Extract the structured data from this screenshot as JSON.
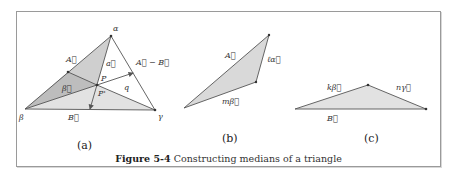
{
  "figure": {
    "caption_label": "Figure 5-4",
    "caption_text": "Constructing medians of a triangle",
    "panels": [
      {
        "id": "a",
        "label": "(a)",
        "vertices": {
          "alpha": "α",
          "beta": "β",
          "gamma": "γ"
        },
        "vector_labels": {
          "A": "A⃗",
          "B": "B⃗",
          "a": "a⃗",
          "beta_vec": "β⃗",
          "A_minus_B": "A⃗ − B⃗",
          "q": "q"
        },
        "points": {
          "P": "P",
          "P_prime": "P'"
        }
      },
      {
        "id": "b",
        "label": "(b)",
        "vector_labels": {
          "A": "A⃗",
          "l_alpha": "ℓα⃗",
          "m_beta": "mβ⃗"
        }
      },
      {
        "id": "c",
        "label": "(c)",
        "vector_labels": {
          "k_beta": "kβ⃗",
          "n_gamma": "nγ⃗",
          "B": "B⃗"
        }
      }
    ]
  },
  "colors": {
    "shade_dark": "#bdbdbd",
    "shade_mid": "#cfcfcf",
    "shade_light": "#e2e2e2",
    "line": "#555555",
    "frame": "#9a9a9a"
  }
}
